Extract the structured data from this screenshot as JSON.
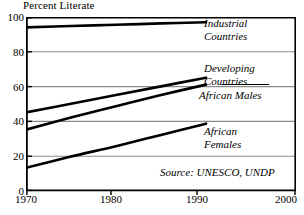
{
  "chart_data": {
    "type": "line",
    "title": "Percent Literate",
    "xlabel": "",
    "ylabel": "Percent Literate",
    "xlim": [
      1970,
      2000
    ],
    "ylim": [
      0,
      100
    ],
    "xticks": [
      "1970",
      "1980",
      "1990",
      "2000"
    ],
    "yticks": [
      "0",
      "20",
      "40",
      "60",
      "80",
      "100"
    ],
    "grid": "horizontal",
    "legend_position": "inline-right",
    "annotations": [
      "Source: UNESCO, UNDP"
    ],
    "series": [
      {
        "name": "Industrial Countries",
        "label_line1": "Industrial",
        "label_line2": "Countries",
        "x": [
          1970,
          1975,
          1980,
          1985,
          1990
        ],
        "values": [
          94,
          94.8,
          95.5,
          96.3,
          97
        ]
      },
      {
        "name": "Developing Countries",
        "label_line1": "Developing",
        "label_line2": "Countries",
        "x": [
          1970,
          1975,
          1980,
          1985,
          1990
        ],
        "values": [
          45,
          50,
          55,
          60,
          65
        ]
      },
      {
        "name": "African Males",
        "label_line1": "African Males",
        "label_line2": "",
        "x": [
          1970,
          1975,
          1980,
          1985,
          1990
        ],
        "values": [
          35,
          42,
          48.5,
          55,
          61
        ]
      },
      {
        "name": "African Females",
        "label_line1": "African",
        "label_line2": "Females",
        "x": [
          1970,
          1975,
          1980,
          1985,
          1990
        ],
        "values": [
          13,
          19.5,
          25.5,
          32,
          38.5
        ]
      }
    ]
  },
  "axis": {
    "y": {
      "t100": "100",
      "t80": "80",
      "t60": "60",
      "t40": "40",
      "t20": "20",
      "t0": "0"
    },
    "x": {
      "t1970": "1970",
      "t1980": "1980",
      "t1990": "1990",
      "t2000": "2000"
    }
  },
  "labels": {
    "industrial_1": "Industrial",
    "industrial_2": "Countries",
    "developing_1": "Developing",
    "developing_2": "Countries",
    "african_males": "African Males",
    "african_females_1": "African",
    "african_females_2": "Females"
  },
  "source": "Source: UNESCO, UNDP",
  "colors": {
    "line": "#000000",
    "grid": "#8a8a8a",
    "axis": "#000000",
    "background": "#ffffff"
  }
}
